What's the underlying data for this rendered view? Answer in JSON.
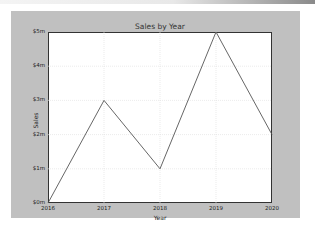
{
  "chart_data": {
    "type": "line",
    "title": "Sales by Year",
    "xlabel": "Year",
    "ylabel": "Sales",
    "categories": [
      "2016",
      "2017",
      "2018",
      "2019",
      "2020"
    ],
    "x": [
      2016,
      2017,
      2018,
      2019,
      2020
    ],
    "series": [
      {
        "name": "Sales",
        "values": [
          0,
          3000000,
          1000000,
          5000000,
          2000000
        ]
      }
    ],
    "ylim": [
      0,
      5000000
    ],
    "xlim": [
      2016,
      2020
    ],
    "yticks": [
      "$0m",
      "$1m",
      "$2m",
      "$3m",
      "$4m",
      "$5m"
    ],
    "xticks": [
      "2016",
      "2017",
      "2018",
      "2019",
      "2020"
    ],
    "grid": true,
    "legend": null,
    "line_color": "#555555"
  }
}
